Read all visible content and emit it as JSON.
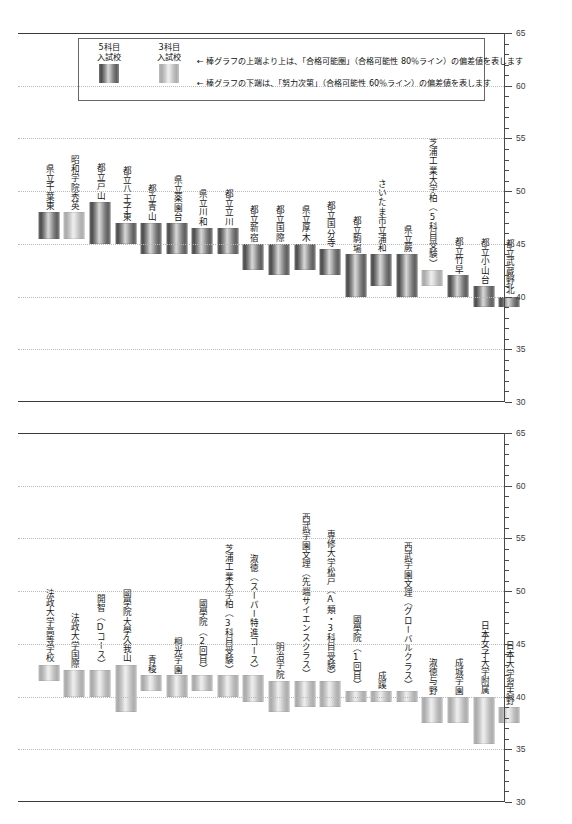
{
  "legend": {
    "keys": [
      {
        "label_line1": "5科目",
        "label_line2": "入試校",
        "style": "dark",
        "name": "5-subject-exam-school"
      },
      {
        "label_line1": "3科目",
        "label_line2": "入試校",
        "style": "light",
        "name": "3-subject-exam-school"
      }
    ],
    "notes": [
      "← 棒グラフの上端より上は、「合格可能圏」（合格可能性 80％ライン）の偏差値を表します",
      "← 棒グラフの下端は、「努力次第」（合格可能性 60％ライン）の偏差値を表します"
    ]
  },
  "axis": {
    "ticklabels": [
      "65",
      "60",
      "55",
      "50",
      "45",
      "40",
      "35",
      "30"
    ],
    "min": 30,
    "max": 65,
    "major_step": 5,
    "minor_step": 1
  },
  "chart_data": [
    {
      "type": "bar",
      "title": "",
      "xlabel": "",
      "ylabel": "偏差値",
      "ylim": [
        30,
        65
      ],
      "grid": true,
      "legend_position": "top-left",
      "value_kind": "range",
      "categories": [
        "県立千葉東",
        "昭和学院秀英",
        "都立戸山",
        "都立八王子東",
        "都立青山",
        "県立薬園台",
        "県立川和",
        "都立立川",
        "都立新宿",
        "都立国際",
        "県立厚木",
        "都立国分寺",
        "都立駒場",
        "さいたま市立浦和",
        "県立蕨",
        "芝浦工業大学柏（5科目受験）",
        "都立竹早",
        "都立小山台",
        "都立武蔵野北"
      ],
      "series": [
        {
          "name": "合格可能圏（80％ライン）上端",
          "values": [
            48,
            48,
            49,
            47,
            47,
            47,
            46.5,
            46.5,
            45,
            45,
            45,
            44.5,
            44,
            44,
            44,
            42.5,
            42,
            41,
            40
          ]
        },
        {
          "name": "努力次第（60％ライン）下端",
          "values": [
            45.5,
            45.5,
            45,
            45,
            44,
            44,
            44,
            44,
            42.5,
            42,
            42.5,
            42,
            40,
            41,
            40,
            41,
            40,
            39,
            39
          ]
        }
      ],
      "bar_styles": [
        "dark",
        "light",
        "dark",
        "dark",
        "dark",
        "dark",
        "dark",
        "dark",
        "dark",
        "dark",
        "dark",
        "dark",
        "dark",
        "dark",
        "dark",
        "light",
        "dark",
        "dark",
        "dark"
      ]
    },
    {
      "type": "bar",
      "title": "",
      "xlabel": "",
      "ylabel": "偏差値",
      "ylim": [
        30,
        65
      ],
      "grid": true,
      "legend_position": "none",
      "value_kind": "range",
      "categories": [
        "法政大学高等学校",
        "法政大学国際",
        "開智（Dコース）",
        "國學院大學久我山",
        "青稜",
        "桐光学園",
        "國學院（2回目）",
        "芝浦工業大学柏（3科目受験）",
        "淑徳（スーパー特進コース）",
        "明治学院",
        "西武学園文理（先端サイエンスクラス）",
        "専修大学松戸（A類・3科目受験）",
        "國學院（1回目）",
        "成蹊",
        "西武学園文理（グローバルクラス）",
        "淑徳与野",
        "成城学園",
        "日本女子大学附属",
        "日本大学習志野"
      ],
      "series": [
        {
          "name": "合格可能圏（80％ライン）上端",
          "values": [
            43,
            42.5,
            42.5,
            43,
            42,
            42,
            42,
            42,
            42,
            41.5,
            41.5,
            41.5,
            40.5,
            40.5,
            40.5,
            40,
            40,
            40,
            39
          ]
        },
        {
          "name": "努力次第（60％ライン）下端",
          "values": [
            41.5,
            40,
            40,
            38.5,
            40.5,
            40,
            40.5,
            40,
            39.5,
            38.5,
            39,
            39,
            39.5,
            39.5,
            39.5,
            37.5,
            37.5,
            35.5,
            37.5
          ]
        }
      ],
      "bar_styles": [
        "light",
        "light",
        "light",
        "light",
        "light",
        "light",
        "light",
        "light",
        "light",
        "light",
        "light",
        "light",
        "light",
        "light",
        "light",
        "light",
        "light",
        "light",
        "light"
      ]
    }
  ]
}
